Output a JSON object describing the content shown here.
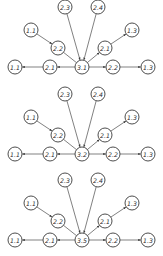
{
  "colors": {
    "stroke": "#3a3a3a",
    "edge": "#4a4a4a",
    "background": "#ffffff",
    "text": "#2a2a2a"
  },
  "node_radius": 7,
  "diagrams": [
    {
      "offset_y": 0,
      "center_label": "3.1",
      "nodes": [
        {
          "id": "top_left",
          "label": "2.3",
          "x": 65,
          "y": 7
        },
        {
          "id": "top_right",
          "label": "2.4",
          "x": 98,
          "y": 7
        },
        {
          "id": "upper_left",
          "label": "1.1",
          "x": 31,
          "y": 30
        },
        {
          "id": "upper_right",
          "label": "1.3",
          "x": 132,
          "y": 30
        },
        {
          "id": "mid_left",
          "label": "2.2",
          "x": 58,
          "y": 48
        },
        {
          "id": "mid_right",
          "label": "2.1",
          "x": 105,
          "y": 48
        },
        {
          "id": "bottom_far_left",
          "label": "1.1",
          "x": 15,
          "y": 67
        },
        {
          "id": "bottom_left",
          "label": "2.1",
          "x": 50,
          "y": 67
        },
        {
          "id": "center",
          "label": "3.1",
          "x": 82,
          "y": 67
        },
        {
          "id": "bottom_right",
          "label": "2.2",
          "x": 113,
          "y": 67
        },
        {
          "id": "bottom_far_right",
          "label": "1.3",
          "x": 148,
          "y": 67
        }
      ]
    },
    {
      "offset_y": 87,
      "center_label": "3.2",
      "nodes": [
        {
          "id": "top_left",
          "label": "2.3",
          "x": 65,
          "y": 7
        },
        {
          "id": "top_right",
          "label": "2.4",
          "x": 98,
          "y": 7
        },
        {
          "id": "upper_left",
          "label": "1.1",
          "x": 31,
          "y": 30
        },
        {
          "id": "upper_right",
          "label": "1.3",
          "x": 132,
          "y": 30
        },
        {
          "id": "mid_left",
          "label": "2.2",
          "x": 58,
          "y": 48
        },
        {
          "id": "mid_right",
          "label": "2.1",
          "x": 105,
          "y": 48
        },
        {
          "id": "bottom_far_left",
          "label": "1.1",
          "x": 15,
          "y": 67
        },
        {
          "id": "bottom_left",
          "label": "2.1",
          "x": 50,
          "y": 67
        },
        {
          "id": "center",
          "label": "3.2",
          "x": 82,
          "y": 67
        },
        {
          "id": "bottom_right",
          "label": "2.2",
          "x": 113,
          "y": 67
        },
        {
          "id": "bottom_far_right",
          "label": "1.3",
          "x": 148,
          "y": 67
        }
      ]
    },
    {
      "offset_y": 173,
      "center_label": "3.5",
      "nodes": [
        {
          "id": "top_left",
          "label": "2.3",
          "x": 65,
          "y": 7
        },
        {
          "id": "top_right",
          "label": "2.4",
          "x": 98,
          "y": 7
        },
        {
          "id": "upper_left",
          "label": "1.1",
          "x": 31,
          "y": 30
        },
        {
          "id": "upper_right",
          "label": "1.3",
          "x": 132,
          "y": 30
        },
        {
          "id": "mid_left",
          "label": "2.2",
          "x": 58,
          "y": 48
        },
        {
          "id": "mid_right",
          "label": "2.1",
          "x": 105,
          "y": 48
        },
        {
          "id": "bottom_far_left",
          "label": "1.1",
          "x": 15,
          "y": 67
        },
        {
          "id": "bottom_left",
          "label": "2.1",
          "x": 50,
          "y": 67
        },
        {
          "id": "center",
          "label": "3.5",
          "x": 82,
          "y": 67
        },
        {
          "id": "bottom_right",
          "label": "2.2",
          "x": 113,
          "y": 67
        },
        {
          "id": "bottom_far_right",
          "label": "1.3",
          "x": 148,
          "y": 67
        }
      ]
    }
  ],
  "edges": [
    {
      "from": "top_left",
      "to": "center",
      "arrow": true
    },
    {
      "from": "top_right",
      "to": "center",
      "arrow": true
    },
    {
      "from": "upper_left",
      "to": "mid_left",
      "arrow": true
    },
    {
      "from": "mid_left",
      "to": "center",
      "arrow": false
    },
    {
      "from": "center",
      "to": "mid_right",
      "arrow": true
    },
    {
      "from": "mid_right",
      "to": "upper_right",
      "arrow": true
    },
    {
      "from": "center",
      "to": "bottom_left",
      "arrow": true
    },
    {
      "from": "bottom_left",
      "to": "bottom_far_left",
      "arrow": true
    },
    {
      "from": "center",
      "to": "bottom_right",
      "arrow": true
    },
    {
      "from": "bottom_right",
      "to": "bottom_far_right",
      "arrow": true
    }
  ]
}
